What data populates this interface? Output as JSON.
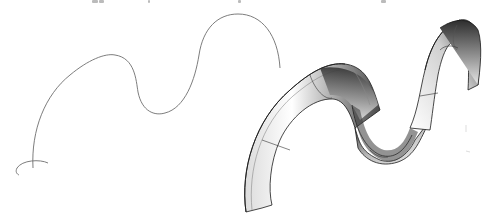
{
  "figure": {
    "panels": [
      {
        "id": "left",
        "label": "profile-curve",
        "description": "Thin wire trajectory curve with small circular cross-section at its start"
      },
      {
        "id": "right",
        "label": "swept-surface",
        "description": "Shaded 3D swept half-tube surface following the trajectory"
      }
    ],
    "colors": {
      "background": "#ffffff",
      "wire": "#6e6e6e",
      "surface_dark": "#2a2a2a",
      "surface_light": "#f4f4f4",
      "outline": "#1a1a1a"
    }
  }
}
